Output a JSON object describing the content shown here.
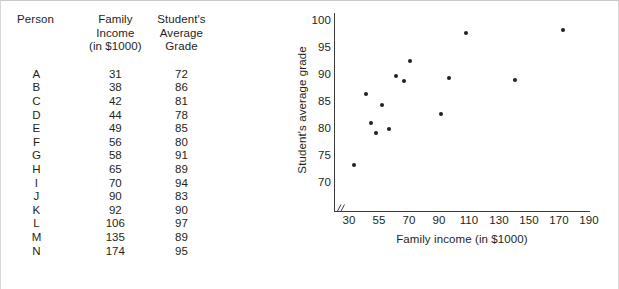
{
  "table": {
    "headers": {
      "person": "Person",
      "income": [
        "Family",
        "Income",
        "(in $1000)"
      ],
      "grade": [
        "Student's",
        "Average",
        "Grade"
      ]
    },
    "rows": [
      {
        "person": "A",
        "income": "31",
        "grade": "72"
      },
      {
        "person": "B",
        "income": "38",
        "grade": "86"
      },
      {
        "person": "C",
        "income": "42",
        "grade": "81"
      },
      {
        "person": "D",
        "income": "44",
        "grade": "78"
      },
      {
        "person": "E",
        "income": "49",
        "grade": "85"
      },
      {
        "person": "F",
        "income": "56",
        "grade": "80"
      },
      {
        "person": "G",
        "income": "58",
        "grade": "91"
      },
      {
        "person": "H",
        "income": "65",
        "grade": "89"
      },
      {
        "person": "I",
        "income": "70",
        "grade": "94"
      },
      {
        "person": "J",
        "income": "90",
        "grade": "83"
      },
      {
        "person": "K",
        "income": "92",
        "grade": "90"
      },
      {
        "person": "L",
        "income": "106",
        "grade": "97"
      },
      {
        "person": "M",
        "income": "135",
        "grade": "89"
      },
      {
        "person": "N",
        "income": "174",
        "grade": "95"
      }
    ]
  },
  "chart_data": {
    "type": "scatter",
    "title": "",
    "xlabel": "Family income (in $1000)",
    "ylabel": "Student's average grade",
    "grid": false,
    "legend": null,
    "axis_break_x": true,
    "xticks": [
      "30",
      "55",
      "70",
      "90",
      "110",
      "130",
      "150",
      "170",
      "190"
    ],
    "xtick_values": [
      30,
      55,
      70,
      90,
      110,
      130,
      150,
      170,
      190
    ],
    "yticks": [
      "70",
      "75",
      "80",
      "85",
      "90",
      "95",
      "100"
    ],
    "ytick_values": [
      70,
      75,
      80,
      85,
      90,
      95,
      100
    ],
    "xlim": [
      30,
      190
    ],
    "ylim": [
      70,
      100
    ],
    "points": [
      {
        "label": "A",
        "x": 31,
        "y": 72,
        "px": 68,
        "py": 164
      },
      {
        "label": "B",
        "x": 38,
        "y": 86,
        "px": 80,
        "py": 93
      },
      {
        "label": "C",
        "x": 42,
        "y": 81,
        "px": 85,
        "py": 122
      },
      {
        "label": "D",
        "x": 44,
        "y": 78,
        "px": 90,
        "py": 132
      },
      {
        "label": "E",
        "x": 49,
        "y": 85,
        "px": 96,
        "py": 104
      },
      {
        "label": "F",
        "x": 56,
        "y": 80,
        "px": 103,
        "py": 128
      },
      {
        "label": "G",
        "x": 58,
        "y": 91,
        "px": 110,
        "py": 75
      },
      {
        "label": "H",
        "x": 65,
        "y": 89,
        "px": 118,
        "py": 80
      },
      {
        "label": "I",
        "x": 70,
        "y": 94,
        "px": 124,
        "py": 60
      },
      {
        "label": "J",
        "x": 90,
        "y": 83,
        "px": 155,
        "py": 113
      },
      {
        "label": "K",
        "x": 92,
        "y": 90,
        "px": 163,
        "py": 77
      },
      {
        "label": "L",
        "x": 106,
        "y": 97,
        "px": 180,
        "py": 32
      },
      {
        "label": "M",
        "x": 135,
        "y": 89,
        "px": 229,
        "py": 79
      },
      {
        "label": "N",
        "x": 174,
        "y": 95,
        "px": 277,
        "py": 29
      }
    ]
  }
}
